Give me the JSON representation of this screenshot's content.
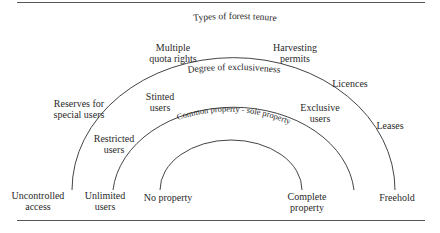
{
  "figure": {
    "title": "Types of forest tenure",
    "arcs": [
      {
        "name": "types-of-forest-tenure",
        "label": "Types of forest tenure"
      },
      {
        "name": "degree-of-exclusiveness",
        "label": "Degree of exclusiveness"
      },
      {
        "name": "common-sole-property",
        "label": "Common property - sole property"
      }
    ],
    "outer_arc_labels": {
      "left_end": [
        "Uncontrolled",
        "access"
      ],
      "reserves": [
        "Reserves for",
        "special users"
      ],
      "multiple_quota": [
        "Multiple",
        "quota rights"
      ],
      "harvesting": [
        "Harvesting",
        "permits"
      ],
      "licences": "Licences",
      "leases": "Leases",
      "right_end": "Freehold"
    },
    "middle_arc_labels": {
      "left_end": [
        "Unlimited",
        "users"
      ],
      "restricted": [
        "Restricted",
        "users"
      ],
      "stinted": [
        "Stinted",
        "users"
      ],
      "exclusive": [
        "Exclusive",
        "users"
      ]
    },
    "inner_arc_labels": {
      "left_end": "No property",
      "right_end": [
        "Complete",
        "property"
      ]
    }
  }
}
